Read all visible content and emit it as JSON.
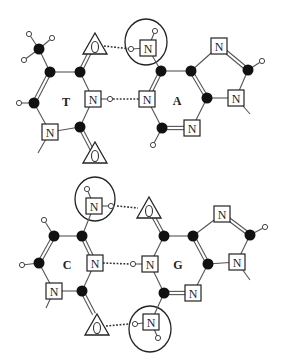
{
  "legend_symbols": {
    "carbon": "filled-circle",
    "hydrogen": "open-circle",
    "nitrogen": "N-in-square",
    "oxygen": "O-in-triangle",
    "donor_acceptor_group": "large-circle"
  },
  "pairs": [
    {
      "name": "T-A",
      "bases": [
        {
          "label": "T",
          "label_pos": [
            66,
            102
          ],
          "carbons": [
            [
              50,
              72
            ],
            [
              80,
              72
            ],
            [
              80,
              127
            ],
            [
              34,
              103
            ],
            [
              39,
              49
            ]
          ],
          "nitrogens": [
            [
              93,
              99
            ],
            [
              50,
              132
            ]
          ],
          "oxygens": [
            [
              95,
              46
            ],
            [
              95,
              155
            ]
          ],
          "hydrogens": [
            [
              29,
              34
            ],
            [
              52,
              38
            ],
            [
              24,
              60
            ],
            [
              19,
              103
            ],
            [
              110,
              99
            ]
          ],
          "bonds": [
            [
              [
                50,
                72
              ],
              [
                80,
                72
              ]
            ],
            [
              [
                80,
                72
              ],
              [
                93,
                99
              ]
            ],
            [
              [
                93,
                99
              ],
              [
                80,
                127
              ]
            ],
            [
              [
                80,
                127
              ],
              [
                50,
                132
              ]
            ],
            [
              [
                50,
                132
              ],
              [
                34,
                103
              ]
            ],
            [
              [
                50,
                72
              ],
              [
                39,
                49
              ]
            ],
            [
              [
                39,
                49
              ],
              [
                29,
                34
              ]
            ],
            [
              [
                39,
                49
              ],
              [
                52,
                38
              ]
            ],
            [
              [
                39,
                49
              ],
              [
                24,
                60
              ]
            ],
            [
              [
                34,
                103
              ],
              [
                19,
                103
              ]
            ],
            [
              [
                93,
                99
              ],
              [
                110,
                99
              ]
            ],
            [
              [
                50,
                132
              ],
              [
                38,
                153
              ]
            ]
          ],
          "double_bonds": [
            [
              [
                50,
                72
              ],
              [
                34,
                103
              ]
            ],
            [
              [
                80,
                72
              ],
              [
                91,
                50
              ]
            ],
            [
              [
                80,
                127
              ],
              [
                92,
                150
              ]
            ]
          ]
        },
        {
          "label": "A",
          "label_pos": [
            177,
            101
          ],
          "carbons": [
            [
              161,
              71
            ],
            [
              191,
              71
            ],
            [
              207,
              98
            ],
            [
              162,
              128
            ],
            [
              248,
              70
            ]
          ],
          "nitrogens": [
            [
              147,
              99
            ],
            [
              192,
              128
            ],
            [
              219,
              46
            ],
            [
              236,
              98
            ],
            [
              148,
              48
            ]
          ],
          "oxygens": [],
          "hydrogens": [
            [
              153,
              145
            ],
            [
              262,
              61
            ],
            [
              155,
              31
            ],
            [
              131,
              49
            ]
          ],
          "bonds": [
            [
              [
                161,
                71
              ],
              [
                191,
                71
              ]
            ],
            [
              [
                207,
                98
              ],
              [
                192,
                128
              ]
            ],
            [
              [
                147,
                99
              ],
              [
                162,
                128
              ]
            ],
            [
              [
                191,
                71
              ],
              [
                219,
                46
              ]
            ],
            [
              [
                248,
                70
              ],
              [
                236,
                98
              ]
            ],
            [
              [
                236,
                98
              ],
              [
                207,
                98
              ]
            ],
            [
              [
                236,
                98
              ],
              [
                250,
                114
              ]
            ],
            [
              [
                162,
                128
              ],
              [
                153,
                145
              ]
            ],
            [
              [
                248,
                70
              ],
              [
                262,
                61
              ]
            ],
            [
              [
                161,
                71
              ],
              [
                148,
                48
              ]
            ],
            [
              [
                148,
                48
              ],
              [
                155,
                31
              ]
            ],
            [
              [
                148,
                48
              ],
              [
                131,
                49
              ]
            ]
          ],
          "double_bonds": [
            [
              [
                161,
                71
              ],
              [
                147,
                99
              ]
            ],
            [
              [
                191,
                71
              ],
              [
                207,
                98
              ]
            ],
            [
              [
                162,
                128
              ],
              [
                192,
                128
              ]
            ],
            [
              [
                219,
                46
              ],
              [
                248,
                70
              ]
            ]
          ],
          "group_circle": {
            "cx": 146,
            "cy": 42,
            "rx": 21,
            "ry": 23
          }
        }
      ],
      "hbonds": [
        [
          [
            104,
            46
          ],
          [
            131,
            49
          ]
        ],
        [
          [
            113,
            99
          ],
          [
            140,
            99
          ]
        ]
      ]
    },
    {
      "name": "C-G",
      "bases": [
        {
          "label": "C",
          "label_pos": [
            67,
            265
          ],
          "carbons": [
            [
              54,
              236
            ],
            [
              82,
              236
            ],
            [
              82,
              291
            ],
            [
              39,
              263
            ]
          ],
          "nitrogens": [
            [
              95,
              263
            ],
            [
              54,
              291
            ],
            [
              94,
              206
            ]
          ],
          "oxygens": [
            [
              97,
              327
            ]
          ],
          "hydrogens": [
            [
              44,
              220
            ],
            [
              22,
              265
            ],
            [
              87,
              189
            ],
            [
              111,
              206
            ]
          ],
          "bonds": [
            [
              [
                54,
                236
              ],
              [
                82,
                236
              ]
            ],
            [
              [
                95,
                263
              ],
              [
                82,
                291
              ]
            ],
            [
              [
                82,
                291
              ],
              [
                54,
                291
              ]
            ],
            [
              [
                54,
                291
              ],
              [
                39,
                263
              ]
            ],
            [
              [
                54,
                236
              ],
              [
                44,
                220
              ]
            ],
            [
              [
                39,
                263
              ],
              [
                22,
                265
              ]
            ],
            [
              [
                82,
                236
              ],
              [
                94,
                206
              ]
            ],
            [
              [
                94,
                206
              ],
              [
                87,
                189
              ]
            ],
            [
              [
                94,
                206
              ],
              [
                111,
                206
              ]
            ],
            [
              [
                54,
                291
              ],
              [
                46,
                308
              ]
            ]
          ],
          "double_bonds": [
            [
              [
                54,
                236
              ],
              [
                39,
                263
              ]
            ],
            [
              [
                82,
                236
              ],
              [
                95,
                263
              ]
            ],
            [
              [
                82,
                291
              ],
              [
                94,
                314
              ]
            ]
          ],
          "group_circle": {
            "cx": 95,
            "cy": 199,
            "rx": 20,
            "ry": 22
          }
        },
        {
          "label": "G",
          "label_pos": [
            178,
            265
          ],
          "carbons": [
            [
              164,
              236
            ],
            [
              193,
              236
            ],
            [
              208,
              264
            ],
            [
              164,
              293
            ],
            [
              250,
              235
            ]
          ],
          "nitrogens": [
            [
              150,
              264
            ],
            [
              193,
              293
            ],
            [
              222,
              214
            ],
            [
              237,
              262
            ],
            [
              151,
              322
            ]
          ],
          "oxygens": [
            [
              149,
              210
            ]
          ],
          "hydrogens": [
            [
              133,
              264
            ],
            [
              265,
              227
            ],
            [
              135,
              324
            ],
            [
              158,
              338
            ]
          ],
          "bonds": [
            [
              [
                164,
                236
              ],
              [
                193,
                236
              ]
            ],
            [
              [
                208,
                264
              ],
              [
                193,
                293
              ]
            ],
            [
              [
                150,
                264
              ],
              [
                164,
                293
              ]
            ],
            [
              [
                164,
                236
              ],
              [
                150,
                264
              ]
            ],
            [
              [
                193,
                236
              ],
              [
                222,
                214
              ]
            ],
            [
              [
                250,
                235
              ],
              [
                237,
                262
              ]
            ],
            [
              [
                237,
                262
              ],
              [
                208,
                264
              ]
            ],
            [
              [
                237,
                262
              ],
              [
                250,
                280
              ]
            ],
            [
              [
                150,
                264
              ],
              [
                133,
                264
              ]
            ],
            [
              [
                250,
                235
              ],
              [
                265,
                227
              ]
            ],
            [
              [
                164,
                293
              ],
              [
                151,
                322
              ]
            ],
            [
              [
                151,
                322
              ],
              [
                135,
                324
              ]
            ],
            [
              [
                151,
                322
              ],
              [
                158,
                338
              ]
            ]
          ],
          "double_bonds": [
            [
              [
                164,
                236
              ],
              [
                152,
                214
              ]
            ],
            [
              [
                193,
                236
              ],
              [
                208,
                264
              ]
            ],
            [
              [
                164,
                293
              ],
              [
                193,
                293
              ]
            ],
            [
              [
                222,
                214
              ],
              [
                250,
                235
              ]
            ]
          ],
          "group_circle": {
            "cx": 150,
            "cy": 329,
            "rx": 21,
            "ry": 23
          }
        }
      ],
      "hbonds": [
        [
          [
            117,
            206
          ],
          [
            138,
            208
          ]
        ],
        [
          [
            103,
            263
          ],
          [
            130,
            264
          ]
        ],
        [
          [
            106,
            326
          ],
          [
            129,
            324
          ]
        ]
      ]
    }
  ]
}
